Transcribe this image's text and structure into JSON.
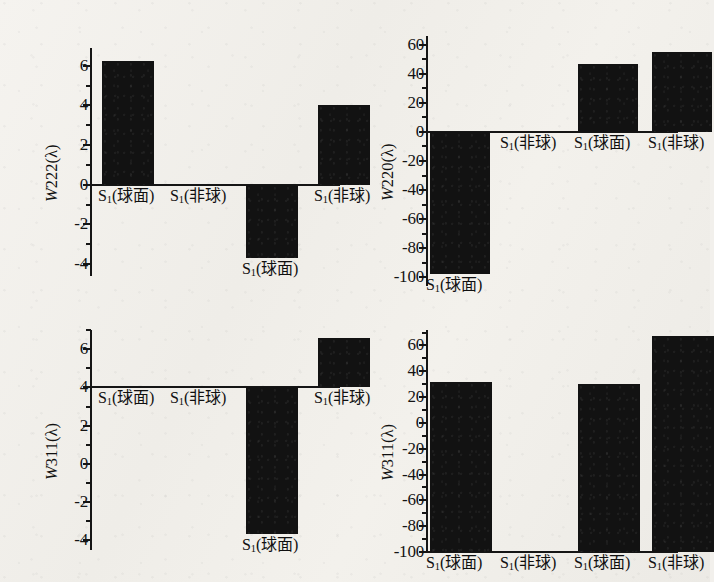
{
  "figure": {
    "background_color": "#f2f0ec",
    "bar_color": "#121212",
    "axis_color": "#151515",
    "panel_count": 4
  },
  "labels": {
    "cat_spherical": "S₁(球面)",
    "cat_aspheric": "S₁(非球)",
    "cat_spherical_prefix": "S",
    "cat_spherical_sub": "1",
    "cat_spherical_suffix": "(球面)",
    "cat_aspheric_suffix": "(非球)"
  },
  "chart_data": [
    {
      "id": "panel-top-left",
      "type": "bar",
      "title": "",
      "ylabel": "W222(λ)",
      "ylabel_italic_prefix": "W",
      "ylabel_rest": "222(λ)",
      "xlabel": "",
      "categories": [
        "S₁(球面)",
        "S₁(非球)",
        "S₁(球面)",
        "S₁(非球)"
      ],
      "values": [
        6.25,
        0,
        -3.7,
        4.0
      ],
      "ylim": [
        -4.6,
        6.9
      ],
      "yticks": [
        -4,
        -2,
        0,
        2,
        4,
        6
      ],
      "ytick_labels": [
        "-4",
        "-2",
        "0",
        "2",
        "4",
        "6"
      ],
      "minor_ticks": true,
      "baseline": 0,
      "grid": false,
      "legend": "none"
    },
    {
      "id": "panel-top-right",
      "type": "bar",
      "title": "",
      "ylabel": "W220(λ)",
      "ylabel_italic_prefix": "W",
      "ylabel_rest": "220(λ)",
      "xlabel": "",
      "categories": [
        "S₁(球面)",
        "S₁(非球)",
        "S₁(球面)",
        "S₁(非球)"
      ],
      "values": [
        -98,
        0,
        47,
        55
      ],
      "ylim": [
        -106,
        66
      ],
      "yticks": [
        -100,
        -80,
        -60,
        -40,
        -20,
        0,
        20,
        40,
        60
      ],
      "ytick_labels": [
        "-100",
        "-80",
        "-60",
        "-40",
        "-20",
        "0",
        "20",
        "40",
        "60"
      ],
      "minor_ticks": true,
      "baseline": 0,
      "grid": false,
      "legend": "none"
    },
    {
      "id": "panel-bottom-left",
      "type": "bar",
      "title": "",
      "ylabel": "W311(λ)",
      "ylabel_italic_prefix": "W",
      "ylabel_rest": "311(λ)",
      "xlabel": "",
      "categories": [
        "S₁(球面)",
        "S₁(非球)",
        "S₁(球面)",
        "S₁(非球)"
      ],
      "values": [
        4.0,
        4.0,
        -3.65,
        6.6
      ],
      "ylim": [
        -4.5,
        7.0
      ],
      "yticks": [
        -4,
        -2,
        0,
        2,
        4,
        6
      ],
      "ytick_labels": [
        "-4",
        "-2",
        "0",
        "2",
        "4",
        "6"
      ],
      "minor_ticks": true,
      "baseline": 4,
      "grid": false,
      "legend": "none"
    },
    {
      "id": "panel-bottom-right",
      "type": "bar",
      "title": "",
      "ylabel": "W311(λ)",
      "ylabel_italic_prefix": "W",
      "ylabel_rest": "311(λ)",
      "xlabel": "",
      "categories": [
        "S₁(球面)",
        "S₁(非球)",
        "S₁(球面)",
        "S₁(非球)"
      ],
      "values": [
        32,
        -100,
        30,
        67
      ],
      "ylim": [
        -100,
        72
      ],
      "yticks": [
        -100,
        -80,
        -60,
        -40,
        -20,
        0,
        20,
        40,
        60
      ],
      "ytick_labels": [
        "-100",
        "-80",
        "-60",
        "-40",
        "-20",
        "0",
        "20",
        "40",
        "60"
      ],
      "minor_ticks": true,
      "baseline": -100,
      "grid": false,
      "legend": "none"
    }
  ]
}
